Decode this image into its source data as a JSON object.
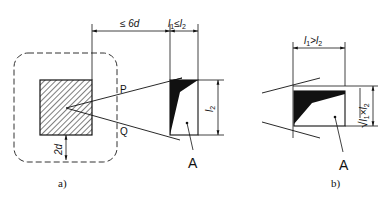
{
  "figure_a": {
    "caption": "a)",
    "dim_distance": "≤ 6d",
    "dim_width": {
      "l": "l",
      "sub1": "1",
      "op": "≤",
      "l2": "l",
      "sub2": "2"
    },
    "dim_height": {
      "l": "l",
      "sub": "2"
    },
    "dim_margin": "2d",
    "point_p": "P",
    "point_q": "Q",
    "area_label": "A"
  },
  "figure_b": {
    "caption": "b)",
    "dim_width": {
      "l": "l",
      "sub1": "1",
      "op": ">",
      "l2": "l",
      "sub2": "2"
    },
    "dim_height": {
      "root": "√",
      "l": "l",
      "sub1": "1",
      "op": "×",
      "l2": "l",
      "sub2": "2"
    },
    "area_label": "A"
  },
  "colors": {
    "line": "#111111",
    "dashed": "#333333",
    "background": "#ffffff"
  }
}
